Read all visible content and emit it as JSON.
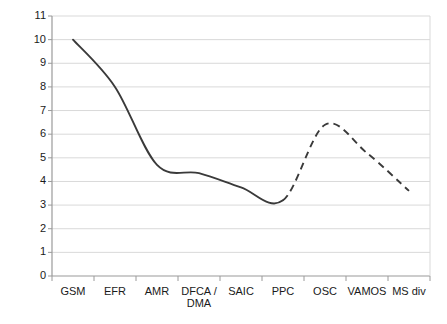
{
  "chart_data": {
    "type": "line",
    "title": "",
    "xlabel": "",
    "ylabel": "",
    "categories": [
      "GSM",
      "EFR",
      "AMR",
      "DFCA /\nDMA",
      "SAIC",
      "PPC",
      "OSC",
      "VAMOS",
      "MS div"
    ],
    "ylim": [
      0,
      11
    ],
    "ytick_labels": [
      "11",
      "10",
      "9",
      "8",
      "7",
      "6",
      "5",
      "4",
      "3",
      "2",
      "1",
      "0"
    ],
    "yticks": [
      11,
      10,
      9,
      8,
      7,
      6,
      5,
      4,
      3,
      2,
      1,
      0
    ],
    "grid": true,
    "grid_axis": "y",
    "legend": "none",
    "series": [
      {
        "name": "capacity trend",
        "values": [
          10.0,
          8.0,
          4.7,
          4.35,
          3.75,
          3.2,
          6.4,
          5.2,
          3.6
        ],
        "style_segments": [
          {
            "from_category": "GSM",
            "to_category": "PPC",
            "linestyle": "solid"
          },
          {
            "from_category": "PPC",
            "to_category": "MS div",
            "linestyle": "dashed"
          }
        ],
        "annotations": [
          {
            "category": "GSM",
            "value": 10.0,
            "note": "start of solid curve"
          },
          {
            "category": "PPC",
            "value": 3.2,
            "note": "minimum, solid-to-dashed transition"
          },
          {
            "category": "OSC",
            "value": 6.45,
            "note": "peak of dashed curve"
          },
          {
            "category": "MS div",
            "value": 3.6,
            "note": "end of dashed curve"
          }
        ]
      }
    ],
    "colors": {
      "line": "#3a3a3a",
      "grid": "#d9d9d9",
      "axis": "#9a9a9a",
      "plot_background": "#ffffff",
      "text": "#1a1a1a"
    },
    "geometry": {
      "plot_left": 52,
      "plot_right": 430,
      "plot_top": 16,
      "plot_bottom": 276
    }
  }
}
